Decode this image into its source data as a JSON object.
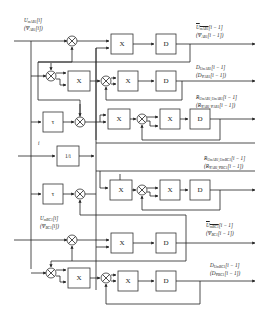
{
  "diagram": {
    "type": "signal-flow block diagram",
    "blocks": {
      "multiplier": "X",
      "delay": "D",
      "shift": "τ",
      "reciprocal": "1/i"
    },
    "inputs": {
      "ab1": {
        "line1": "U",
        "line1_sub": "mAB1",
        "line1_idx": "[i]",
        "line2": "(Ψ",
        "line2_sub": "AB1",
        "line2_idx": "[i])"
      },
      "index": {
        "label": "i"
      },
      "bc1": {
        "line1": "U",
        "line1_sub": "mBC1",
        "line1_idx": "[i]",
        "line2": "(Ψ",
        "line2_sub": "BC1",
        "line2_idx": "[i])"
      }
    },
    "outputs": [
      {
        "line1": "U",
        "line1_sub": "mAB1",
        "line1_idx": "[i − 1]",
        "line2": "(Ψ",
        "line2_sub": "AB1",
        "line2_idx": "[i − 1])",
        "overline": true
      },
      {
        "line1": "D",
        "line1_sub": "UmAB1",
        "line1_idx": "[i − 1]",
        "line2": "(D",
        "line2_sub": "ΨAB1",
        "line2_idx": "[i − 1])",
        "overline": false
      },
      {
        "line1": "R",
        "line1_sub": "UmAB1,UmAB1",
        "line1_idx": "[i − 1]",
        "line2": "(R",
        "line2_sub": "ΨAB1,ΨAB1",
        "line2_idx": "[i − 1])",
        "overline": false
      },
      {
        "line1": "R",
        "line1_sub": "UmAB1,UmBC1",
        "line1_idx": "[i − 1]",
        "line2": "(R",
        "line2_sub": "ΨAB1,ΨBC1",
        "line2_idx": "[i − 1])",
        "overline": false
      },
      {
        "line1": "U",
        "line1_sub": "mBC1",
        "line1_idx": "[i − 1]",
        "line2": "(Ψ",
        "line2_sub": "BC1",
        "line2_idx": "[i − 1])",
        "overline": true
      },
      {
        "line1": "D",
        "line1_sub": "UmBC1",
        "line1_idx": "[i − 1]",
        "line2": "(D",
        "line2_sub": "ΨBC1",
        "line2_idx": "[i − 1])",
        "overline": false
      }
    ]
  }
}
